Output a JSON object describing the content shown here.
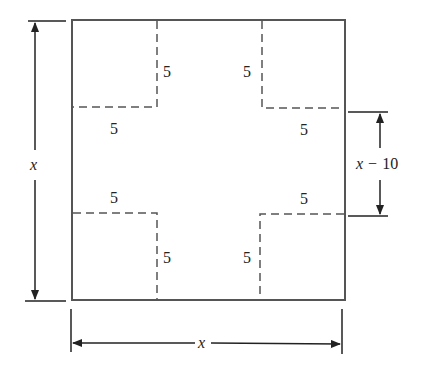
{
  "diagram": {
    "colors": {
      "outline": "#555555",
      "dashed": "#555555",
      "dimension": "#222222",
      "background": "#ffffff"
    },
    "corner_labels": {
      "top_left_vertical": "5",
      "top_left_horizontal": "5",
      "top_right_vertical": "5",
      "top_right_horizontal": "5",
      "bottom_left_horizontal": "5",
      "bottom_left_vertical": "5",
      "bottom_right_horizontal": "5",
      "bottom_right_vertical": "5"
    },
    "dimensions": {
      "left_height": "x",
      "bottom_width": "x",
      "right_inner": "x − 10"
    }
  }
}
